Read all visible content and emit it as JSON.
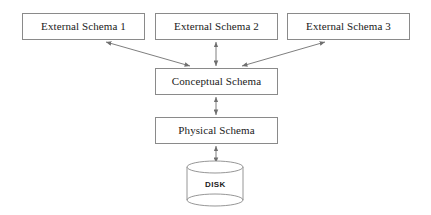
{
  "diagram": {
    "background_color": "#ffffff",
    "line_color": "#8a8a8a",
    "text_color": "#1a1a1a",
    "boxes": [
      {
        "id": "external-schema-1",
        "label": "External Schema 1",
        "x": 22,
        "y": 13,
        "w": 123,
        "h": 27
      },
      {
        "id": "external-schema-2",
        "label": "External Schema 2",
        "x": 155,
        "y": 13,
        "w": 123,
        "h": 27
      },
      {
        "id": "external-schema-3",
        "label": "External Schema 3",
        "x": 287,
        "y": 13,
        "w": 123,
        "h": 27
      },
      {
        "id": "conceptual-schema",
        "label": "Conceptual Schema",
        "x": 155,
        "y": 68,
        "w": 123,
        "h": 27
      },
      {
        "id": "physical-schema",
        "label": "Physical Schema",
        "x": 155,
        "y": 117,
        "w": 123,
        "h": 27
      }
    ],
    "disk": {
      "label": "DISK",
      "cx": 215,
      "top_y": 167,
      "bottom_y": 200,
      "rx": 28,
      "ry": 6
    },
    "connectors": [
      {
        "id": "conceptual-to-external-1",
        "from": "conceptual-schema",
        "to": "external-schema-1",
        "kind": "double-arrow",
        "x1": 190,
        "y1": 66,
        "x2": 106,
        "y2": 42
      },
      {
        "id": "conceptual-to-external-2",
        "from": "conceptual-schema",
        "to": "external-schema-2",
        "kind": "double-arrow",
        "x1": 216,
        "y1": 66,
        "x2": 216,
        "y2": 42
      },
      {
        "id": "conceptual-to-external-3",
        "from": "conceptual-schema",
        "to": "external-schema-3",
        "kind": "double-arrow",
        "x1": 242,
        "y1": 66,
        "x2": 325,
        "y2": 42
      },
      {
        "id": "physical-to-conceptual",
        "from": "physical-schema",
        "to": "conceptual-schema",
        "kind": "double-arrow",
        "x1": 216,
        "y1": 115,
        "x2": 216,
        "y2": 97
      },
      {
        "id": "disk-to-physical",
        "from": "disk",
        "to": "physical-schema",
        "kind": "double-arrow",
        "x1": 216,
        "y1": 163,
        "x2": 216,
        "y2": 146
      }
    ]
  }
}
